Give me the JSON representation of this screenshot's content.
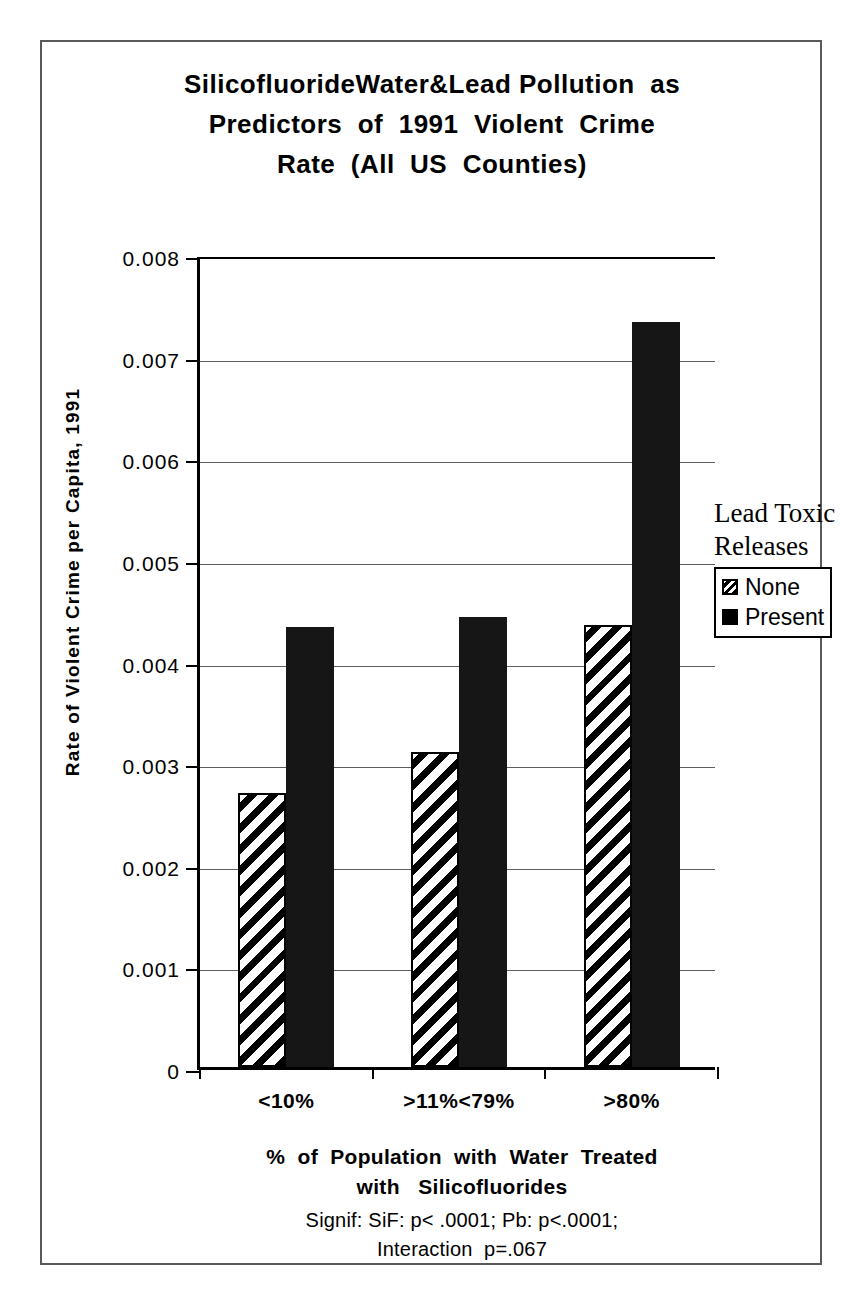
{
  "title": {
    "lines": [
      "SilicofluorideWater&Lead Pollution  as",
      "Predictors  of  1991  Violent  Crime",
      "Rate  (All  US  Counties)"
    ]
  },
  "axes": {
    "y_title": "Rate of Violent Crime per Capita, 1991",
    "y_ticks": [
      "0.008",
      "0.007",
      "0.006",
      "0.005",
      "0.004",
      "0.003",
      "0.002",
      "0.001",
      "0"
    ],
    "x_title_lines": [
      "%  of  Population  with  Water  Treated",
      "with   Silicofluorides"
    ]
  },
  "notes": {
    "lines": [
      "Signif: SiF: p< .0001; Pb: p<.0001;",
      "Interaction  p=.067"
    ]
  },
  "legend": {
    "title_lines": [
      "Lead Toxic",
      "Releases"
    ],
    "entries": [
      {
        "label": "None",
        "swatch": "hatched-square-icon"
      },
      {
        "label": "Present",
        "swatch": "solid-black-square-icon"
      }
    ]
  },
  "chart_data": {
    "type": "bar",
    "title": "SilicofluorideWater&Lead Pollution as Predictors of 1991 Violent Crime Rate (All US Counties)",
    "xlabel": "% of Population with Water Treated with Silicofluorides",
    "ylabel": "Rate of Violent Crime per Capita, 1991",
    "categories": [
      "<10%",
      ">11%<79%",
      ">80%"
    ],
    "series": [
      {
        "name": "None",
        "values": [
          0.0027,
          0.0031,
          0.00435
        ]
      },
      {
        "name": "Present",
        "values": [
          0.00433,
          0.00443,
          0.00733
        ]
      }
    ],
    "ylim": [
      0,
      0.008
    ],
    "ytick_step": 0.001,
    "grid": true,
    "legend_position": "right",
    "legend_title": "Lead Toxic Releases",
    "annotations": [
      "Signif: SiF: p< .0001; Pb: p<.0001;",
      "Interaction p=.067"
    ]
  }
}
